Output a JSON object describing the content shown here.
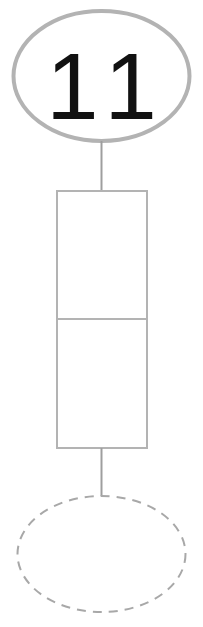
{
  "canvas": {
    "width": 203,
    "height": 627,
    "background": "#ffffff"
  },
  "diagram": {
    "type": "node-link-diagram",
    "stroke_color_solid": "#b3b3b3",
    "stroke_color_dashed": "#a8a8a8",
    "connector_color": "#9e9e9e",
    "label_color": "#111111",
    "nodes": [
      {
        "id": "top-ellipse",
        "shape": "ellipse",
        "style": "solid",
        "label": "11",
        "stroke_width": 4,
        "cx": 101.5,
        "cy": 76,
        "rx": 88,
        "ry": 65
      },
      {
        "id": "middle-rectangle",
        "shape": "rectangle",
        "style": "solid",
        "label": "",
        "stroke_width": 2,
        "x": 56,
        "y": 190,
        "width": 91,
        "height": 258,
        "cells": [
          {
            "id": "rect-cell-top",
            "label": ""
          },
          {
            "id": "rect-cell-bottom",
            "label": ""
          }
        ],
        "divider_y": 319
      },
      {
        "id": "bottom-ellipse",
        "shape": "ellipse",
        "style": "dashed",
        "label": "",
        "stroke_width": 2,
        "cx": 101.5,
        "cy": 554,
        "rx": 84,
        "ry": 58,
        "dash_pattern": "9 7"
      }
    ],
    "connectors": [
      {
        "id": "connector-top",
        "from": "top-ellipse",
        "to": "middle-rectangle",
        "x": 101.5,
        "y1": 141,
        "y2": 190,
        "stroke_width": 2
      },
      {
        "id": "connector-bottom",
        "from": "middle-rectangle",
        "to": "bottom-ellipse",
        "x": 101.5,
        "y1": 448,
        "y2": 496,
        "stroke_width": 2
      }
    ]
  }
}
